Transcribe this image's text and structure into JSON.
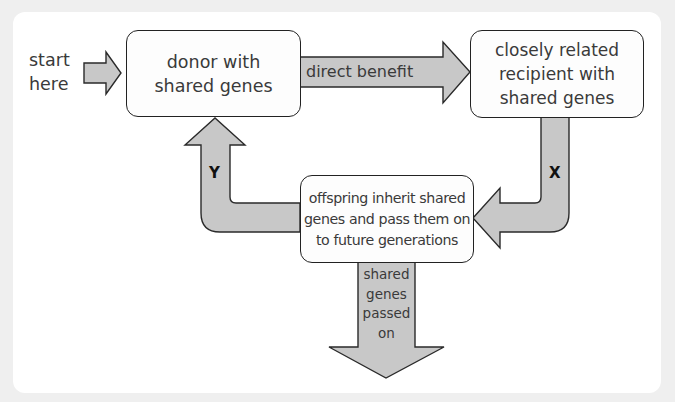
{
  "diagram": {
    "start_label": "start\nhere",
    "nodes": {
      "donor": "donor with\nshared genes",
      "recipient": "closely related\nrecipient with\nshared genes",
      "offspring": "offspring inherit shared\ngenes and pass them on\nto future generations"
    },
    "edges": {
      "direct_benefit": "direct benefit",
      "x_label": "X",
      "y_label": "Y",
      "passed_on": "shared\ngenes\npassed\non"
    },
    "colors": {
      "arrow_fill": "#c8c8c8",
      "arrow_stroke": "#2a2a2a",
      "box_fill": "#fdfdfd",
      "box_stroke": "#222222",
      "panel_bg": "#ffffff",
      "page_bg": "#efefef"
    }
  }
}
